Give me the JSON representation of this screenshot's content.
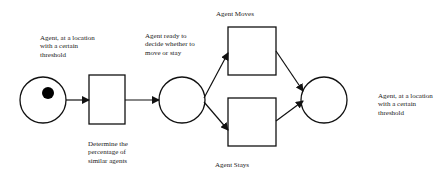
{
  "diagram": {
    "type": "petri-net",
    "nodes": [
      {
        "id": "place-start",
        "kind": "place",
        "token": true,
        "label": "Agent, at a location\nwith a certain\nthreshold"
      },
      {
        "id": "transition-determine",
        "kind": "transition",
        "label": "Determine the\npercentage of\nsimilar agents"
      },
      {
        "id": "place-decide",
        "kind": "place",
        "token": false,
        "label": "Agent ready to\ndecide whether to\nmove or stay"
      },
      {
        "id": "transition-moves",
        "kind": "transition",
        "label": "Agent Moves"
      },
      {
        "id": "transition-stays",
        "kind": "transition",
        "label": "Agent Stays"
      },
      {
        "id": "place-end",
        "kind": "place",
        "token": false,
        "label": "Agent, at a location\nwith a certain\nthreshold"
      }
    ],
    "edges": [
      {
        "from": "place-start",
        "to": "transition-determine"
      },
      {
        "from": "transition-determine",
        "to": "place-decide"
      },
      {
        "from": "place-decide",
        "to": "transition-moves"
      },
      {
        "from": "place-decide",
        "to": "transition-stays"
      },
      {
        "from": "transition-moves",
        "to": "place-end"
      },
      {
        "from": "transition-stays",
        "to": "place-end"
      }
    ],
    "colors": {
      "stroke": "#111111",
      "token": "#000000",
      "background": "#ffffff"
    }
  }
}
